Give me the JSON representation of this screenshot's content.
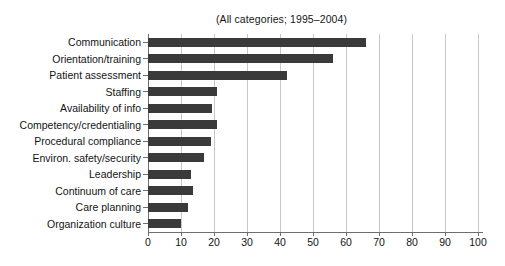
{
  "chart_data": {
    "type": "bar",
    "orientation": "horizontal",
    "title": "(All categories; 1995–2004)",
    "xlabel": "",
    "ylabel": "",
    "xlim": [
      0,
      100
    ],
    "xticks": [
      0,
      10,
      20,
      30,
      40,
      50,
      60,
      70,
      80,
      90,
      100
    ],
    "grid": true,
    "grid_axis": "x",
    "legend": false,
    "bar_color": "#3a3a3a",
    "grid_color": "#c8c8c8",
    "axis_color": "#6e6e6e",
    "categories": [
      "Communication",
      "Orientation/training",
      "Patient assessment",
      "Staffing",
      "Availability of info",
      "Competency/credentialing",
      "Procedural compliance",
      "Environ. safety/security",
      "Leadership",
      "Continuum of care",
      "Care planning",
      "Organization culture"
    ],
    "values": [
      66,
      56,
      42,
      21,
      19.5,
      21,
      19,
      17,
      13,
      13.5,
      12,
      10
    ]
  }
}
